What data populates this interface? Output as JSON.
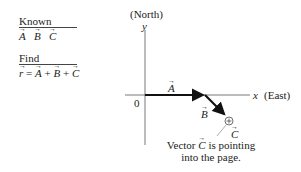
{
  "known": {
    "heading": "Known",
    "items": [
      "A",
      "B",
      "C"
    ]
  },
  "find": {
    "heading": "Find",
    "lhs": "r",
    "eq": " = ",
    "terms": [
      "A",
      "B",
      "C"
    ],
    "plus": " + "
  },
  "axes": {
    "north_label": "(North)",
    "y_label": "y",
    "x_label": "x",
    "east_label": "(East)",
    "origin_label": "0"
  },
  "vectors": {
    "a_label": "A",
    "b_label": "B",
    "c_label": "C"
  },
  "caption": {
    "line1_pre": "Vector ",
    "line1_vec": "C",
    "line1_post": " is pointing",
    "line2": "into the page."
  },
  "colors": {
    "axis": "#555555",
    "vector": "#111111",
    "text": "#222222"
  }
}
